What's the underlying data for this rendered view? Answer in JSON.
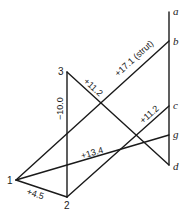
{
  "diagram": {
    "type": "truss-force-diagram",
    "nodes": [
      {
        "id": "a",
        "label": "a",
        "x": 169,
        "y": 12,
        "style": "italic"
      },
      {
        "id": "b",
        "label": "b",
        "x": 169,
        "y": 41,
        "style": "italic"
      },
      {
        "id": "c",
        "label": "c",
        "x": 169,
        "y": 106,
        "style": "italic"
      },
      {
        "id": "g",
        "label": "g",
        "x": 169,
        "y": 135,
        "style": "italic"
      },
      {
        "id": "d",
        "label": "d",
        "x": 169,
        "y": 165,
        "style": "italic"
      },
      {
        "id": "n3",
        "label": "3",
        "x": 67,
        "y": 72,
        "style": "upright"
      },
      {
        "id": "n1",
        "label": "1",
        "x": 16,
        "y": 180,
        "style": "upright"
      },
      {
        "id": "n2",
        "label": "2",
        "x": 67,
        "y": 197,
        "style": "upright"
      }
    ],
    "members": [
      {
        "from": "a",
        "to": "d",
        "label": ""
      },
      {
        "from": "n1",
        "to": "b",
        "label": "+17.1 (strut)"
      },
      {
        "from": "n3",
        "to": "d",
        "label": "+11.2"
      },
      {
        "from": "n3",
        "to": "n2",
        "label": "−10.0"
      },
      {
        "from": "n2",
        "to": "c",
        "label": "+11.2"
      },
      {
        "from": "n1",
        "to": "g",
        "label": "+13.4"
      },
      {
        "from": "n1",
        "to": "n2",
        "label": "+4.5"
      }
    ]
  }
}
